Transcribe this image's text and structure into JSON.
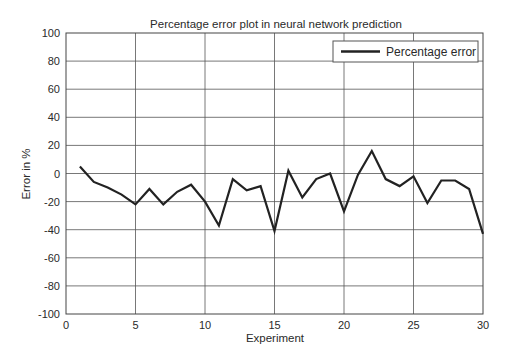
{
  "chart_data": {
    "type": "line",
    "title": "Percentage error plot in neural network prediction",
    "xlabel": "Experiment",
    "ylabel": "Error in %",
    "xlim": [
      0,
      30
    ],
    "ylim": [
      -100,
      100
    ],
    "x_ticks": [
      0,
      5,
      10,
      15,
      20,
      25,
      30
    ],
    "y_ticks": [
      -100,
      -80,
      -60,
      -40,
      -20,
      0,
      20,
      40,
      60,
      80,
      100
    ],
    "grid": true,
    "legend_position": "upper right",
    "x": [
      1,
      2,
      3,
      4,
      5,
      6,
      7,
      8,
      9,
      10,
      11,
      12,
      13,
      14,
      15,
      16,
      17,
      18,
      19,
      20,
      21,
      22,
      23,
      24,
      25,
      26,
      27,
      28,
      29,
      30
    ],
    "series": [
      {
        "name": "Percentage error",
        "color": "#222222",
        "values": [
          5,
          -6,
          -10,
          -15,
          -22,
          -11,
          -22,
          -13,
          -8,
          -20,
          -37,
          -4,
          -12,
          -9,
          -41,
          2,
          -17,
          -4,
          0,
          -27,
          -1,
          16,
          -4,
          -9,
          -2,
          -21,
          -5,
          -5,
          -11,
          -43
        ]
      }
    ]
  },
  "colors": {
    "line": "#222222",
    "grid": "#555555",
    "background": "#ffffff",
    "text": "#2a2a2a"
  }
}
